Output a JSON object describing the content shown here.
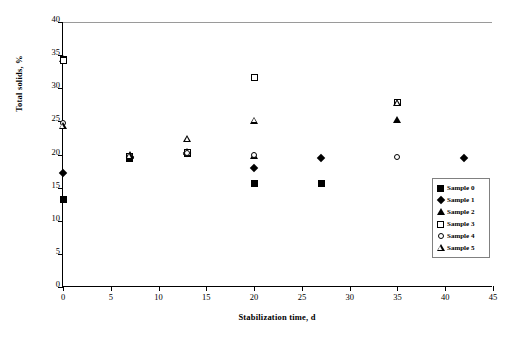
{
  "chart_data": {
    "type": "scatter",
    "title": "",
    "xlabel": "Stabilization time, d",
    "ylabel": "Total solids, %",
    "xlim": [
      0,
      45
    ],
    "ylim": [
      0,
      40
    ],
    "xticks": [
      0,
      5,
      10,
      15,
      20,
      25,
      30,
      35,
      40,
      45
    ],
    "yticks": [
      0,
      5,
      10,
      15,
      20,
      25,
      30,
      35,
      40
    ],
    "grid": false,
    "legend_position": "right-inside",
    "series": [
      {
        "name": "Sample 0",
        "marker": "filled-square",
        "points": [
          {
            "x": 0,
            "y": 13.2
          },
          {
            "x": 0,
            "y": 34.3
          },
          {
            "x": 7,
            "y": 19.4
          },
          {
            "x": 13,
            "y": 20.2
          },
          {
            "x": 20,
            "y": 15.6
          },
          {
            "x": 27,
            "y": 15.6
          }
        ]
      },
      {
        "name": "Sample 1",
        "marker": "filled-diamond",
        "points": [
          {
            "x": 0,
            "y": 17.2
          },
          {
            "x": 7,
            "y": 19.6
          },
          {
            "x": 13,
            "y": 20.3
          },
          {
            "x": 20,
            "y": 18.0
          },
          {
            "x": 27,
            "y": 19.5
          },
          {
            "x": 42,
            "y": 19.4
          }
        ]
      },
      {
        "name": "Sample 2",
        "marker": "filled-triangle",
        "points": [
          {
            "x": 0,
            "y": 34.4
          },
          {
            "x": 7,
            "y": 19.9
          },
          {
            "x": 13,
            "y": 20.4
          },
          {
            "x": 20,
            "y": 19.7
          },
          {
            "x": 35,
            "y": 25.2
          }
        ]
      },
      {
        "name": "Sample 3",
        "marker": "open-square",
        "points": [
          {
            "x": 0,
            "y": 34.2
          },
          {
            "x": 7,
            "y": 19.7
          },
          {
            "x": 13,
            "y": 20.3
          },
          {
            "x": 20,
            "y": 31.6
          },
          {
            "x": 35,
            "y": 27.9
          }
        ]
      },
      {
        "name": "Sample 4",
        "marker": "open-circle",
        "points": [
          {
            "x": 0,
            "y": 24.7
          },
          {
            "x": 7,
            "y": 19.8
          },
          {
            "x": 13,
            "y": 20.3
          },
          {
            "x": 20,
            "y": 19.9
          },
          {
            "x": 35,
            "y": 19.6
          }
        ]
      },
      {
        "name": "Sample 5",
        "marker": "open-triangle",
        "points": [
          {
            "x": 0,
            "y": 24.3
          },
          {
            "x": 7,
            "y": 19.8
          },
          {
            "x": 13,
            "y": 22.3
          },
          {
            "x": 20,
            "y": 25.1
          },
          {
            "x": 35,
            "y": 27.8
          }
        ]
      }
    ]
  },
  "legend": {
    "entries": [
      {
        "label": "Sample 0",
        "marker": "filled-square"
      },
      {
        "label": "Sample 1",
        "marker": "filled-diamond"
      },
      {
        "label": "Sample 2",
        "marker": "filled-triangle"
      },
      {
        "label": "Sample 3",
        "marker": "open-square"
      },
      {
        "label": "Sample 4",
        "marker": "open-circle"
      },
      {
        "label": "Sample 5",
        "marker": "open-triangle"
      }
    ]
  },
  "colors": {
    "marker": "#000000",
    "axis": "#000000",
    "legend_border": "#808080",
    "background": "#ffffff"
  }
}
